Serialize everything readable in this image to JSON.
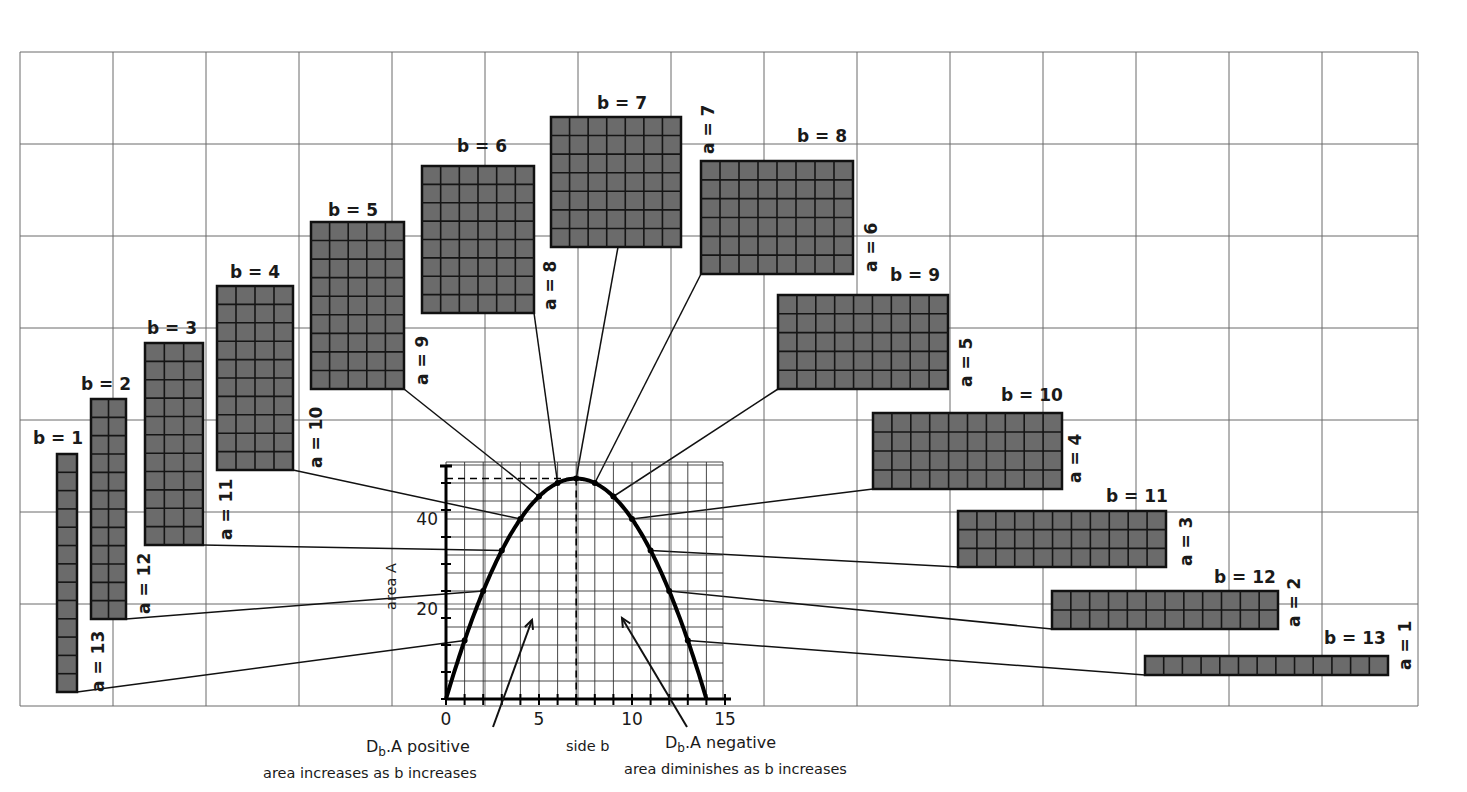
{
  "figure": {
    "background_grid": {
      "x_lines": [
        20,
        113,
        206,
        299,
        392,
        485,
        578,
        671,
        764,
        857,
        950,
        1043,
        1136,
        1229,
        1322,
        1418
      ],
      "y_lines": [
        52,
        144,
        236,
        328,
        420,
        512,
        604,
        706
      ],
      "color": "#6a6a6a"
    },
    "rect_fill_color": "#6b6b6b",
    "cell_line_color": "#151515",
    "rectangles": [
      {
        "b": 1,
        "a": 13,
        "x": 57,
        "y": 454,
        "w": 20,
        "h": 238,
        "b_label": "b = 1",
        "a_label": "a = 13",
        "b_label_pos": [
          33,
          444
        ],
        "a_label_pos": [
          104,
          692
        ],
        "connector_from": [
          77,
          692
        ],
        "curve_b": 1
      },
      {
        "b": 2,
        "a": 12,
        "x": 91,
        "y": 399,
        "w": 35,
        "h": 220,
        "b_label": "b = 2",
        "a_label": "a = 12",
        "b_label_pos": [
          81,
          390
        ],
        "a_label_pos": [
          150,
          614
        ],
        "connector_from": [
          126,
          619
        ],
        "curve_b": 2
      },
      {
        "b": 3,
        "a": 11,
        "x": 145,
        "y": 343,
        "w": 58,
        "h": 202,
        "b_label": "b = 3",
        "a_label": "a = 11",
        "b_label_pos": [
          147,
          334
        ],
        "a_label_pos": [
          232,
          540
        ],
        "connector_from": [
          203,
          545
        ],
        "curve_b": 3
      },
      {
        "b": 4,
        "a": 10,
        "x": 217,
        "y": 286,
        "w": 76,
        "h": 184,
        "b_label": "b = 4",
        "a_label": "a = 10",
        "b_label_pos": [
          230,
          278
        ],
        "a_label_pos": [
          322,
          468
        ],
        "connector_from": [
          293,
          470
        ],
        "curve_b": 4
      },
      {
        "b": 5,
        "a": 9,
        "x": 311,
        "y": 222,
        "w": 93,
        "h": 167,
        "b_label": "b = 5",
        "a_label": "a = 9",
        "b_label_pos": [
          328,
          216
        ],
        "a_label_pos": [
          428,
          385
        ],
        "connector_from": [
          404,
          389
        ],
        "curve_b": 5
      },
      {
        "b": 6,
        "a": 8,
        "x": 422,
        "y": 166,
        "w": 112,
        "h": 147,
        "b_label": "b = 6",
        "a_label": "a = 8",
        "b_label_pos": [
          457,
          152
        ],
        "a_label_pos": [
          556,
          310
        ],
        "connector_from": [
          534,
          313
        ],
        "curve_b": 6
      },
      {
        "b": 7,
        "a": 7,
        "x": 551,
        "y": 117,
        "w": 130,
        "h": 130,
        "b_label": "b = 7",
        "a_label": "a = 7",
        "b_label_pos": [
          597,
          109
        ],
        "a_label_pos": [
          714,
          154
        ],
        "connector_from": [
          618,
          247
        ],
        "curve_b": 7
      },
      {
        "b": 8,
        "a": 6,
        "x": 701,
        "y": 161,
        "w": 152,
        "h": 113,
        "b_label": "b = 8",
        "a_label": "a = 6",
        "b_label_pos": [
          797,
          142
        ],
        "a_label_pos": [
          877,
          272
        ],
        "connector_from": [
          701,
          274
        ],
        "curve_b": 8
      },
      {
        "b": 9,
        "a": 5,
        "x": 778,
        "y": 295,
        "w": 170,
        "h": 94,
        "b_label": "b = 9",
        "a_label": "a = 5",
        "b_label_pos": [
          890,
          281
        ],
        "a_label_pos": [
          972,
          387
        ],
        "connector_from": [
          778,
          389
        ],
        "curve_b": 9
      },
      {
        "b": 10,
        "a": 4,
        "x": 873,
        "y": 413,
        "w": 189,
        "h": 76,
        "b_label": "b = 10",
        "a_label": "a = 4",
        "b_label_pos": [
          1001,
          401
        ],
        "a_label_pos": [
          1081,
          483
        ],
        "connector_from": [
          873,
          489
        ],
        "curve_b": 10
      },
      {
        "b": 11,
        "a": 3,
        "x": 958,
        "y": 511,
        "w": 208,
        "h": 56,
        "b_label": "b = 11",
        "a_label": "a = 3",
        "b_label_pos": [
          1106,
          502
        ],
        "a_label_pos": [
          1192,
          566
        ],
        "connector_from": [
          958,
          567
        ],
        "curve_b": 11
      },
      {
        "b": 12,
        "a": 2,
        "x": 1052,
        "y": 591,
        "w": 226,
        "h": 38,
        "b_label": "b = 12",
        "a_label": "a = 2",
        "b_label_pos": [
          1214,
          583
        ],
        "a_label_pos": [
          1300,
          627
        ],
        "connector_from": [
          1052,
          629
        ],
        "curve_b": 12
      },
      {
        "b": 13,
        "a": 1,
        "x": 1145,
        "y": 656,
        "w": 243,
        "h": 19,
        "b_label": "b = 13",
        "a_label": "a = 1",
        "b_label_pos": [
          1324,
          644
        ],
        "a_label_pos": [
          1411,
          670
        ],
        "connector_from": [
          1145,
          675
        ],
        "curve_b": 13
      }
    ],
    "mini_graph": {
      "origin": [
        446,
        699
      ],
      "px_per_b": 18.6,
      "px_per_A": 4.5,
      "grid_top": 462,
      "grid_right": 723,
      "minor_step_b": 1,
      "minor_step_A": 4,
      "x_axis_end": 731,
      "y_axis_top": 466,
      "x_ticks": [
        {
          "v": 0,
          "label": "0"
        },
        {
          "v": 5,
          "label": "5"
        },
        {
          "v": 10,
          "label": "10"
        },
        {
          "v": 15,
          "label": "15"
        }
      ],
      "y_ticks": [
        {
          "v": 20,
          "label": "20"
        },
        {
          "v": 40,
          "label": "40"
        }
      ],
      "x_label": "side b",
      "y_label": "area A",
      "max_point": {
        "b": 7,
        "A": 49
      },
      "perimeter_half": 14
    },
    "annotations": {
      "left_title_prefix": "D",
      "left_title_sub": "b",
      "left_title_suffix": ".A  positive",
      "left_caption": "area increases as b  increases",
      "right_title_prefix": "D",
      "right_title_sub": "b",
      "right_title_suffix": ".A negative",
      "right_caption": "area diminishes as b increases",
      "left_arrow": {
        "from": [
          493,
          727
        ],
        "to": [
          532,
          620
        ]
      },
      "right_arrow": {
        "from": [
          687,
          727
        ],
        "to": [
          622,
          618
        ]
      }
    }
  },
  "chart_data": {
    "type": "line",
    "title": "",
    "xlabel": "side b",
    "ylabel": "area A",
    "x": [
      0,
      1,
      2,
      3,
      4,
      5,
      6,
      7,
      8,
      9,
      10,
      11,
      12,
      13,
      14
    ],
    "series": [
      {
        "name": "A = b(14 - b)",
        "values": [
          0,
          13,
          24,
          33,
          40,
          45,
          48,
          49,
          48,
          45,
          40,
          33,
          24,
          13,
          0
        ]
      }
    ],
    "x_ticks": [
      "0",
      "5",
      "10",
      "15"
    ],
    "y_ticks": [
      "20",
      "40"
    ],
    "xlim": [
      0,
      15
    ],
    "ylim": [
      0,
      52
    ],
    "grid": true,
    "annotations": [
      "Db.A positive — area increases as b increases",
      "Db.A negative — area diminishes as b increases"
    ],
    "rectangles": [
      {
        "b": 1,
        "a": 13
      },
      {
        "b": 2,
        "a": 12
      },
      {
        "b": 3,
        "a": 11
      },
      {
        "b": 4,
        "a": 10
      },
      {
        "b": 5,
        "a": 9
      },
      {
        "b": 6,
        "a": 8
      },
      {
        "b": 7,
        "a": 7
      },
      {
        "b": 8,
        "a": 6
      },
      {
        "b": 9,
        "a": 5
      },
      {
        "b": 10,
        "a": 4
      },
      {
        "b": 11,
        "a": 3
      },
      {
        "b": 12,
        "a": 2
      },
      {
        "b": 13,
        "a": 1
      }
    ]
  }
}
